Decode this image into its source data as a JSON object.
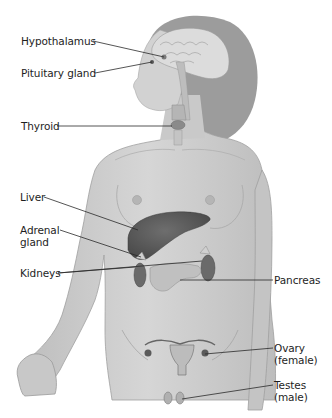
{
  "figure": {
    "colors": {
      "background": "#ffffff",
      "skin": "#cfcfcf",
      "skin_shadow": "#a9a9a9",
      "hair": "#9a9a9a",
      "brain": "#d9d9d9",
      "organ_dark": "#5a5a5a",
      "organ_mid": "#7a7a7a",
      "pancreas": "#bdbdbd",
      "leader_line": "#2a2a2a",
      "text": "#1e1e1e"
    },
    "labels": [
      {
        "id": "hypothalamus",
        "text": "Hypothalamus",
        "side": "left"
      },
      {
        "id": "pituitary",
        "text": "Pituitary gland",
        "side": "left"
      },
      {
        "id": "thyroid",
        "text": "Thyroid",
        "side": "left"
      },
      {
        "id": "liver",
        "text": "Liver",
        "side": "left"
      },
      {
        "id": "adrenal",
        "text": "Adrenal\ngland",
        "side": "left"
      },
      {
        "id": "kidneys",
        "text": "Kidneys",
        "side": "left"
      },
      {
        "id": "pancreas",
        "text": "Pancreas",
        "side": "right"
      },
      {
        "id": "ovary",
        "text": "Ovary\n(female)",
        "side": "right"
      },
      {
        "id": "testes",
        "text": "Testes\n(male)",
        "side": "right"
      }
    ]
  }
}
